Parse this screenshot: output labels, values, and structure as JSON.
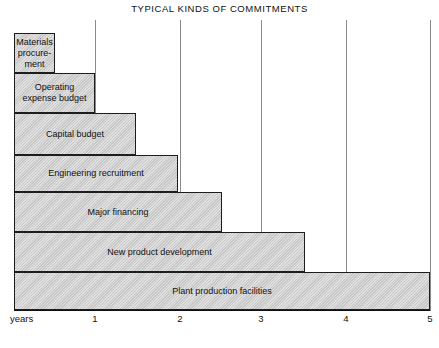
{
  "chart_data": {
    "type": "bar",
    "orientation": "horizontal",
    "title": "TYPICAL KINDS OF COMMITMENTS",
    "xlabel": "years",
    "ylabel": "",
    "xlim": [
      0,
      5
    ],
    "grid": true,
    "legend": "none",
    "xticks": [
      1,
      2,
      3,
      4,
      5
    ],
    "xtick_labels": [
      "1",
      "2",
      "3",
      "4",
      "5"
    ],
    "categories": [
      "Materials procure-ment",
      "Operating expense budget",
      "Capital budget",
      "Engineering recruitment",
      "Major financing",
      "New product development",
      "Plant production facilities"
    ],
    "values": [
      0.5,
      1.0,
      1.47,
      1.97,
      2.5,
      3.5,
      5.0
    ],
    "bars": [
      {
        "label": "Materials\nprocure-\nment",
        "value": 0.5,
        "x": 14,
        "y": 33,
        "w": 41,
        "h": 40
      },
      {
        "label": "Operating\nexpense budget",
        "value": 1.0,
        "x": 14,
        "y": 73,
        "w": 81,
        "h": 40
      },
      {
        "label": "Capital budget",
        "value": 1.47,
        "x": 14,
        "y": 113,
        "w": 122,
        "h": 42
      },
      {
        "label": "Engineering recruitment",
        "value": 1.97,
        "x": 14,
        "y": 155,
        "w": 164,
        "h": 37
      },
      {
        "label": "Major financing",
        "value": 2.5,
        "x": 14,
        "y": 192,
        "w": 208,
        "h": 40
      },
      {
        "label": "New product development",
        "value": 3.5,
        "x": 14,
        "y": 232,
        "w": 291,
        "h": 40
      },
      {
        "label": "Plant production facilities",
        "value": 5.0,
        "x": 14,
        "y": 272,
        "w": 416,
        "h": 38
      }
    ],
    "gridline_x": [
      95,
      180,
      261,
      346,
      430
    ],
    "colors": {
      "bar_fill": "#d2d2d2",
      "bar_border": "#1d1d1d",
      "gridline": "#8a8a8a",
      "axis": "#111111",
      "text": "#111111",
      "background": "#ffffff"
    }
  }
}
